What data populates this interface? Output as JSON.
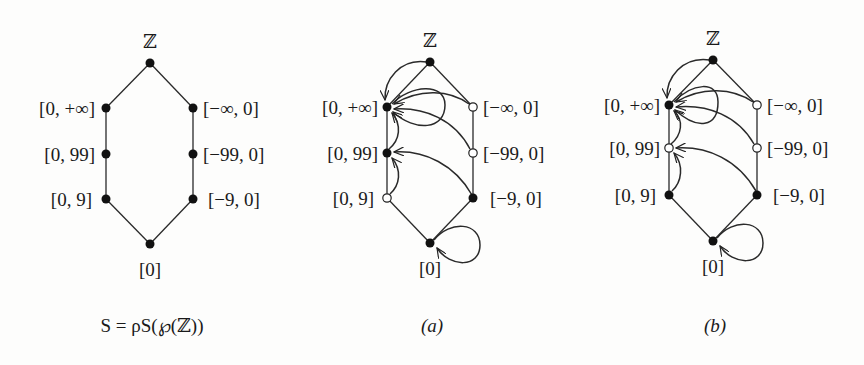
{
  "figure": {
    "panels": [
      {
        "id": "S",
        "caption": "S = ρS(℘(ℤ))",
        "nodes": [
          {
            "id": "Z",
            "label": "ℤ",
            "state": "filled"
          },
          {
            "id": "pos_inf",
            "label": "[0, +∞]",
            "state": "filled"
          },
          {
            "id": "neg_inf",
            "label": "[−∞, 0]",
            "state": "filled"
          },
          {
            "id": "pos_99",
            "label": "[0, 99]",
            "state": "filled"
          },
          {
            "id": "neg_99",
            "label": "[−99, 0]",
            "state": "filled"
          },
          {
            "id": "pos_9",
            "label": "[0, 9]",
            "state": "filled"
          },
          {
            "id": "neg_9",
            "label": "[−9, 0]",
            "state": "filled"
          },
          {
            "id": "zero",
            "label": "[0]",
            "state": "filled"
          }
        ]
      },
      {
        "id": "a",
        "caption": "(a)",
        "nodes": [
          {
            "id": "Z",
            "label": "ℤ",
            "state": "filled"
          },
          {
            "id": "pos_inf",
            "label": "[0, +∞]",
            "state": "filled"
          },
          {
            "id": "neg_inf",
            "label": "[−∞, 0]",
            "state": "open"
          },
          {
            "id": "pos_99",
            "label": "[0, 99]",
            "state": "filled"
          },
          {
            "id": "neg_99",
            "label": "[−99, 0]",
            "state": "open"
          },
          {
            "id": "pos_9",
            "label": "[0, 9]",
            "state": "open"
          },
          {
            "id": "neg_9",
            "label": "[−9, 0]",
            "state": "filled"
          },
          {
            "id": "zero",
            "label": "[0]",
            "state": "filled"
          }
        ],
        "arrows": [
          {
            "from": "Z",
            "to": "pos_inf"
          },
          {
            "from": "pos_inf",
            "to": "pos_inf",
            "type": "self-loop"
          },
          {
            "from": "neg_inf",
            "to": "pos_inf"
          },
          {
            "from": "neg_99",
            "to": "pos_inf"
          },
          {
            "from": "pos_99",
            "to": "pos_inf"
          },
          {
            "from": "neg_9",
            "to": "pos_99"
          },
          {
            "from": "pos_9",
            "to": "pos_99"
          },
          {
            "from": "zero",
            "to": "zero",
            "type": "self-loop"
          }
        ]
      },
      {
        "id": "b",
        "caption": "(b)",
        "nodes": [
          {
            "id": "Z",
            "label": "ℤ",
            "state": "filled"
          },
          {
            "id": "pos_inf",
            "label": "[0, +∞]",
            "state": "filled"
          },
          {
            "id": "neg_inf",
            "label": "[−∞, 0]",
            "state": "open"
          },
          {
            "id": "pos_99",
            "label": "[0, 99]",
            "state": "open"
          },
          {
            "id": "neg_99",
            "label": "[−99, 0]",
            "state": "open"
          },
          {
            "id": "pos_9",
            "label": "[0, 9]",
            "state": "filled"
          },
          {
            "id": "neg_9",
            "label": "[−9, 0]",
            "state": "filled"
          },
          {
            "id": "zero",
            "label": "[0]",
            "state": "filled"
          }
        ],
        "arrows": [
          {
            "from": "Z",
            "to": "pos_inf"
          },
          {
            "from": "pos_inf",
            "to": "pos_inf",
            "type": "self-loop"
          },
          {
            "from": "neg_inf",
            "to": "pos_inf"
          },
          {
            "from": "neg_99",
            "to": "pos_inf"
          },
          {
            "from": "pos_99",
            "to": "pos_inf"
          },
          {
            "from": "neg_9",
            "to": "pos_99"
          },
          {
            "from": "pos_9",
            "to": "pos_99"
          },
          {
            "from": "zero",
            "to": "zero",
            "type": "self-loop"
          }
        ]
      }
    ]
  }
}
